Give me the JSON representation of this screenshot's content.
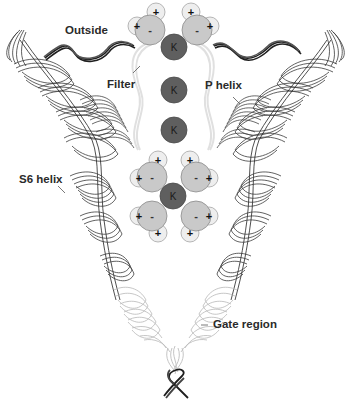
{
  "figure": {
    "labels": {
      "outside": "Outside",
      "filter": "Filter",
      "p_helix": "P helix",
      "s6_helix": "S6 helix",
      "gate_region": "Gate region"
    },
    "ions": [
      {
        "symbol": "K",
        "cx": 174,
        "cy": 47
      },
      {
        "symbol": "K",
        "cx": 174,
        "cy": 90
      },
      {
        "symbol": "K",
        "cx": 174,
        "cy": 130
      },
      {
        "symbol": "K",
        "cx": 173,
        "cy": 196
      }
    ],
    "water": {
      "oxygen_sign": "-",
      "hydrogen_sign": "+",
      "molecules": [
        {
          "cx": 150,
          "cy": 30,
          "h": [
            [
              137,
              26
            ],
            [
              156,
              12
            ]
          ]
        },
        {
          "cx": 197,
          "cy": 30,
          "h": [
            [
              210,
              26
            ],
            [
              191,
              12
            ]
          ]
        },
        {
          "cx": 152,
          "cy": 177,
          "h": [
            [
              139,
              178
            ],
            [
              158,
              160
            ]
          ]
        },
        {
          "cx": 196,
          "cy": 177,
          "h": [
            [
              209,
              178
            ],
            [
              190,
              160
            ]
          ]
        },
        {
          "cx": 152,
          "cy": 216,
          "h": [
            [
              139,
              216
            ],
            [
              158,
              233
            ]
          ]
        },
        {
          "cx": 196,
          "cy": 216,
          "h": [
            [
              209,
              216
            ],
            [
              190,
              233
            ]
          ]
        }
      ]
    },
    "colors": {
      "ion_fill": "#5f5f5f",
      "oxygen_fill": "#c9c9c9",
      "hydrogen_fill": "#eeeeee",
      "helix_dark": "#333333",
      "helix_light": "#b8b8b8",
      "filter_line": "#e2e2e2",
      "text": "#2a2a2a"
    }
  }
}
